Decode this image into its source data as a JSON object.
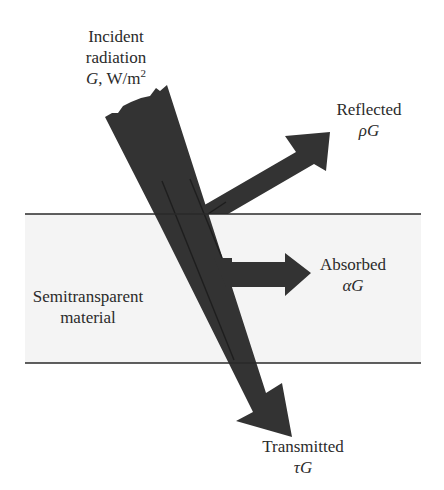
{
  "figure": {
    "incident": {
      "line1": "Incident",
      "line2": "radiation",
      "symbol": "G",
      "unit": ", W/m",
      "unit_exponent": "2"
    },
    "reflected": {
      "label": "Reflected",
      "symbol": "ρG"
    },
    "absorbed": {
      "label": "Absorbed",
      "symbol": "αG"
    },
    "transmitted": {
      "label": "Transmitted",
      "symbol": "τG"
    },
    "material": {
      "line1": "Semitransparent",
      "line2": "material"
    }
  },
  "colors": {
    "arrow": "#333333",
    "slab": "#f4f4f4",
    "surface_line": "#2a2a2a",
    "text": "#2b2b2b"
  }
}
